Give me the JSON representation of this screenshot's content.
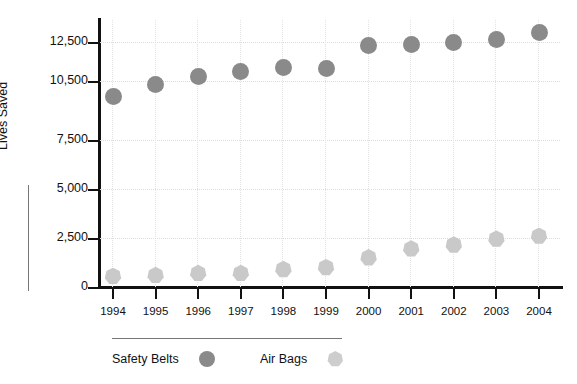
{
  "chart_data": {
    "type": "scatter",
    "title": "",
    "subtitle": "",
    "xlabel": "",
    "ylabel": "Lives Saved",
    "categories": [
      "1994",
      "1995",
      "1996",
      "1997",
      "1998",
      "1999",
      "2000",
      "2001",
      "2002",
      "2003",
      "2004"
    ],
    "x": [
      1994,
      1995,
      1996,
      1997,
      1998,
      1999,
      2000,
      2001,
      2002,
      2003,
      2004
    ],
    "ylim": [
      0,
      13500
    ],
    "y_ticks": [
      0,
      2500,
      5000,
      7500,
      10500,
      12500
    ],
    "y_tick_labels": [
      "0",
      "2,500",
      "5,000",
      "7,500",
      "10,500",
      "12,500"
    ],
    "grid": true,
    "grid_style": "dotted",
    "legend_position": "bottom",
    "series": [
      {
        "name": "Safety Belts",
        "marker": "circle",
        "color": "#8a8a8a",
        "values": [
          9700,
          10350,
          10750,
          11000,
          11200,
          11150,
          12300,
          12350,
          12500,
          12650,
          13000
        ]
      },
      {
        "name": "Air Bags",
        "marker": "heptagon",
        "color": "#c9c9c9",
        "values": [
          550,
          600,
          700,
          700,
          900,
          1000,
          1500,
          1950,
          2150,
          2450,
          2600
        ]
      }
    ]
  },
  "legend": {
    "items": [
      {
        "label": "Safety Belts",
        "swatch": "circle-marker-dark"
      },
      {
        "label": "Air Bags",
        "swatch": "heptagon-marker-light"
      }
    ]
  },
  "axis": {
    "y_title": "Lives Saved"
  }
}
